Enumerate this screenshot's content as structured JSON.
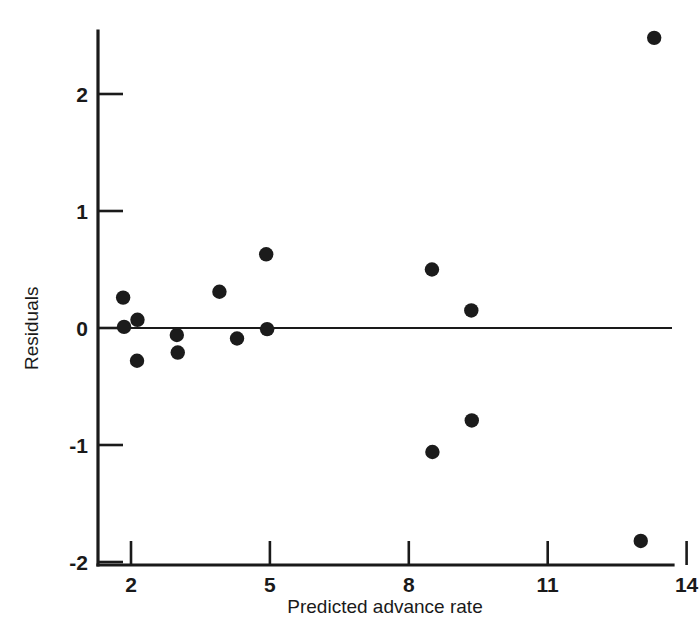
{
  "chart_data": {
    "type": "scatter",
    "title": "",
    "xlabel": "Predicted advance rate",
    "ylabel": "Residuals",
    "xlim": [
      1.0,
      14.0
    ],
    "ylim": [
      -2.0,
      2.6
    ],
    "xticks": [
      2,
      5,
      8,
      11,
      14
    ],
    "xtick_labels": [
      "2",
      "5",
      "8",
      "11",
      "14"
    ],
    "yticks": [
      2,
      1,
      0,
      -1,
      -2
    ],
    "ytick_labels": [
      "2",
      "1",
      "0",
      "-1",
      "-2"
    ],
    "grid": false,
    "legend": null,
    "reference_lines": [
      {
        "name": "zero-residual-line",
        "orientation": "horizontal",
        "value": 0
      }
    ],
    "points": [
      {
        "x": 1.83,
        "y": 0.26
      },
      {
        "x": 1.85,
        "y": 0.01
      },
      {
        "x": 2.14,
        "y": 0.07
      },
      {
        "x": 2.13,
        "y": -0.28
      },
      {
        "x": 2.99,
        "y": -0.06
      },
      {
        "x": 3.01,
        "y": -0.21
      },
      {
        "x": 3.91,
        "y": 0.31
      },
      {
        "x": 4.29,
        "y": -0.09
      },
      {
        "x": 4.92,
        "y": 0.63
      },
      {
        "x": 4.94,
        "y": -0.01
      },
      {
        "x": 8.5,
        "y": 0.5
      },
      {
        "x": 9.35,
        "y": 0.15
      },
      {
        "x": 9.36,
        "y": -0.79
      },
      {
        "x": 8.51,
        "y": -1.06
      },
      {
        "x": 13.3,
        "y": 2.48
      },
      {
        "x": 13.01,
        "y": -1.82
      }
    ]
  },
  "axes": {
    "y_axis_label": "Residuals",
    "x_axis_label": "Predicted advance rate"
  },
  "colors": {
    "background": "#ffffff",
    "ink": "#1a1a1a",
    "marker": "#1b1b1b"
  }
}
